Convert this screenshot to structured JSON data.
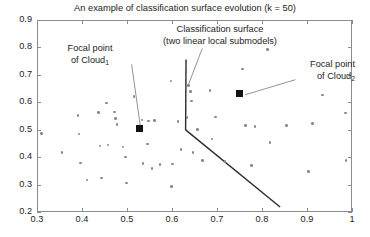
{
  "chart_data": {
    "type": "scatter",
    "title": "An example of classification surface evolution (k = 50)",
    "xlabel": "",
    "ylabel": "",
    "xlim": [
      0.3,
      1.0
    ],
    "ylim": [
      0.2,
      0.9
    ],
    "xticks": [
      "0.3",
      "0.4",
      "0.5",
      "0.6",
      "0.7",
      "0.8",
      "0.9",
      "1"
    ],
    "yticks": [
      "0.2",
      "0.3",
      "0.4",
      "0.5",
      "0.6",
      "0.7",
      "0.8",
      "0.9"
    ],
    "grid": false,
    "legend": "none",
    "point_color": "#8a8a8a",
    "marker_color": "#131313",
    "line_color": "#2b2b2b",
    "series": [
      {
        "name": "data-cloud",
        "marker": "circle",
        "points": [
          [
            0.31,
            0.486
          ],
          [
            0.356,
            0.417
          ],
          [
            0.391,
            0.552
          ],
          [
            0.393,
            0.485
          ],
          [
            0.397,
            0.379
          ],
          [
            0.411,
            0.316
          ],
          [
            0.437,
            0.562
          ],
          [
            0.44,
            0.441
          ],
          [
            0.443,
            0.324
          ],
          [
            0.455,
            0.597
          ],
          [
            0.458,
            0.444
          ],
          [
            0.472,
            0.565
          ],
          [
            0.474,
            0.541
          ],
          [
            0.478,
            0.519
          ],
          [
            0.491,
            0.437
          ],
          [
            0.497,
            0.4
          ],
          [
            0.499,
            0.305
          ],
          [
            0.516,
            0.621
          ],
          [
            0.533,
            0.535
          ],
          [
            0.536,
            0.376
          ],
          [
            0.545,
            0.448
          ],
          [
            0.548,
            0.532
          ],
          [
            0.556,
            0.359
          ],
          [
            0.561,
            0.534
          ],
          [
            0.573,
            0.374
          ],
          [
            0.598,
            0.678
          ],
          [
            0.599,
            0.294
          ],
          [
            0.601,
            0.375
          ],
          [
            0.613,
            0.53
          ],
          [
            0.62,
            0.427
          ],
          [
            0.633,
            0.544
          ],
          [
            0.637,
            0.662
          ],
          [
            0.641,
            0.639
          ],
          [
            0.643,
            0.605
          ],
          [
            0.647,
            0.416
          ],
          [
            0.657,
            0.5
          ],
          [
            0.668,
            0.387
          ],
          [
            0.684,
            0.644
          ],
          [
            0.689,
            0.466
          ],
          [
            0.697,
            0.546
          ],
          [
            0.718,
            0.385
          ],
          [
            0.757,
            0.722
          ],
          [
            0.763,
            0.516
          ],
          [
            0.777,
            0.37
          ],
          [
            0.784,
            0.512
          ],
          [
            0.812,
            0.793
          ],
          [
            0.818,
            0.453
          ],
          [
            0.854,
            0.516
          ],
          [
            0.903,
            0.348
          ],
          [
            0.912,
            0.523
          ],
          [
            0.935,
            0.627
          ],
          [
            0.985,
            0.561
          ],
          [
            0.987,
            0.388
          ]
        ]
      }
    ],
    "focal_points": [
      {
        "name": "focal-point-cloud-1",
        "x": 0.528,
        "y": 0.503
      },
      {
        "name": "focal-point-cloud-2",
        "x": 0.751,
        "y": 0.631
      }
    ],
    "classification_surface": {
      "name": "classification-surface",
      "segments": [
        {
          "name": "upper-vertical-submodel",
          "from": [
            0.629,
            0.76
          ],
          "to": [
            0.628,
            0.503
          ]
        },
        {
          "name": "lower-oblique-submodel",
          "from": [
            0.628,
            0.503
          ],
          "to": [
            0.838,
            0.222
          ]
        }
      ]
    },
    "annotations": [
      {
        "name": "annotation-focal-cloud-1",
        "line1": "Focal point",
        "line2_pre": "of Cloud",
        "line2_sub": "1",
        "leader_from": [
          0.508,
          0.742
        ],
        "leader_to": [
          0.528,
          0.51
        ]
      },
      {
        "name": "annotation-classification-surface",
        "line1": "Classification surface",
        "line2_pre": "(two linear local submodels)",
        "line2_sub": "",
        "leader_from": [
          0.665,
          0.8
        ],
        "leader_to": [
          0.633,
          0.662
        ]
      },
      {
        "name": "annotation-focal-cloud-2",
        "line1": "Focal point",
        "line2_pre": "of Cloud",
        "line2_sub": "2",
        "leader_from": [
          0.872,
          0.686
        ],
        "leader_to": [
          0.76,
          0.631
        ]
      }
    ]
  }
}
